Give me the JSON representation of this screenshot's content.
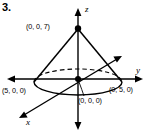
{
  "figure": {
    "problem_number": "3.",
    "axes": {
      "z_label": "z",
      "y_label": "y",
      "x_label": "x"
    },
    "points": [
      {
        "name": "apex",
        "label": "(0, 0, 7)",
        "coords": [
          0,
          0,
          7
        ],
        "marker": "filled-dot"
      },
      {
        "name": "origin",
        "label": "(0, 0, 0)",
        "coords": [
          0,
          0,
          0
        ],
        "marker": "filled-dot"
      },
      {
        "name": "x-intercept",
        "label": "(5, 0, 0)",
        "coords": [
          5,
          0,
          0
        ],
        "marker": "none"
      },
      {
        "name": "y-intercept",
        "label": "(0, 5, 0)",
        "coords": [
          0,
          5,
          0
        ],
        "marker": "none"
      }
    ],
    "colors": {
      "ink": "#000000",
      "background": "#ffffff"
    }
  }
}
